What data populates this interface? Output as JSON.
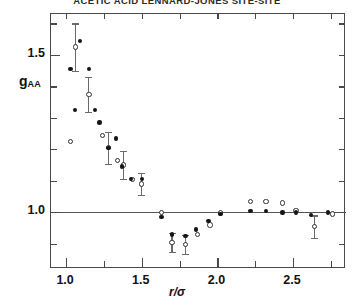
{
  "figure": {
    "title": "ACETIC ACID LENNARD-JONES SITE-SITE",
    "x_axis_label": "r/σ",
    "y_axis_label_base": "g",
    "y_axis_label_sub": "AA"
  },
  "axes": {
    "x_ticks_major": [
      "1.0",
      "1.5",
      "2.0",
      "2.5"
    ],
    "x_tick_values": [
      1.0,
      1.5,
      2.0,
      2.5
    ],
    "x_minor_step": 0.25,
    "y_ticks_major": [
      "1.0",
      "1.5"
    ],
    "y_tick_values": [
      1.0,
      1.5
    ],
    "y_minor_step": 0.1,
    "xlim": [
      0.9,
      2.85
    ],
    "ylim": [
      0.82,
      1.63
    ],
    "reference_line_y": 1.0
  },
  "chart_data": {
    "type": "scatter",
    "title": "ACETIC ACID LENNARD-JONES SITE-SITE",
    "xlabel": "r/σ",
    "ylabel": "gAA",
    "xlim": [
      0.9,
      2.85
    ],
    "ylim": [
      0.82,
      1.63
    ],
    "grid": false,
    "legend": "none",
    "reference_line_y": 1.0,
    "series": [
      {
        "name": "open-circles-with-error-bars",
        "marker": "open circle",
        "color": "#303030",
        "points": [
          {
            "x": 1.03,
            "y": 1.225
          },
          {
            "x": 1.06,
            "y": 1.525,
            "yerr": 0.075
          },
          {
            "x": 1.15,
            "y": 1.375,
            "yerr": 0.055
          },
          {
            "x": 1.24,
            "y": 1.245
          },
          {
            "x": 1.28,
            "y": 1.205,
            "yerr": 0.05
          },
          {
            "x": 1.34,
            "y": 1.165
          },
          {
            "x": 1.38,
            "y": 1.15,
            "yerr": 0.045
          },
          {
            "x": 1.44,
            "y": 1.105
          },
          {
            "x": 1.5,
            "y": 1.09,
            "yerr": 0.035
          },
          {
            "x": 1.63,
            "y": 1.0
          },
          {
            "x": 1.7,
            "y": 0.905,
            "yerr": 0.03
          },
          {
            "x": 1.79,
            "y": 0.898,
            "yerr": 0.03
          },
          {
            "x": 1.87,
            "y": 0.93
          },
          {
            "x": 1.95,
            "y": 0.96
          },
          {
            "x": 2.02,
            "y": 0.998
          },
          {
            "x": 2.22,
            "y": 1.035
          },
          {
            "x": 2.32,
            "y": 1.035
          },
          {
            "x": 2.43,
            "y": 1.03
          },
          {
            "x": 2.52,
            "y": 1.005
          },
          {
            "x": 2.64,
            "y": 0.955,
            "yerr": 0.035
          },
          {
            "x": 2.76,
            "y": 0.995
          }
        ]
      },
      {
        "name": "filled-dots",
        "marker": "filled circle",
        "color": "#151515",
        "points": [
          {
            "x": 1.03,
            "y": 1.455
          },
          {
            "x": 1.09,
            "y": 1.545
          },
          {
            "x": 1.06,
            "y": 1.325
          },
          {
            "x": 1.15,
            "y": 1.455
          },
          {
            "x": 1.19,
            "y": 1.325
          },
          {
            "x": 1.22,
            "y": 1.285
          },
          {
            "x": 1.28,
            "y": 1.205
          },
          {
            "x": 1.33,
            "y": 1.235
          },
          {
            "x": 1.37,
            "y": 1.145
          },
          {
            "x": 1.43,
            "y": 1.105
          },
          {
            "x": 1.5,
            "y": 1.105
          },
          {
            "x": 1.63,
            "y": 0.985
          },
          {
            "x": 1.7,
            "y": 0.93
          },
          {
            "x": 1.79,
            "y": 0.925
          },
          {
            "x": 1.86,
            "y": 0.945
          },
          {
            "x": 1.94,
            "y": 0.972
          },
          {
            "x": 2.02,
            "y": 0.995
          },
          {
            "x": 2.22,
            "y": 1.005
          },
          {
            "x": 2.32,
            "y": 1.005
          },
          {
            "x": 2.43,
            "y": 1.0
          },
          {
            "x": 2.52,
            "y": 1.0
          },
          {
            "x": 2.62,
            "y": 0.992
          },
          {
            "x": 2.73,
            "y": 1.0
          }
        ]
      }
    ]
  }
}
